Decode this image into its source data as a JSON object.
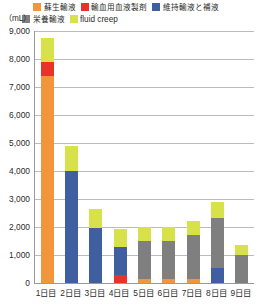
{
  "chart_data": {
    "type": "bar",
    "stacked": true,
    "title": "",
    "subtitle": "",
    "xlabel": "",
    "ylabel": "(mL)",
    "ylim": [
      0,
      9000
    ],
    "ytick_step": 1000,
    "grid": true,
    "legend_position": "top",
    "categories": [
      "1日目",
      "2日目",
      "3日目",
      "4日目",
      "5日目",
      "6日目",
      "7日目",
      "8日目",
      "9日目"
    ],
    "ytick_labels": [
      "9,000",
      "8,000",
      "7,000",
      "6,000",
      "5,000",
      "4,000",
      "3,000",
      "2,000",
      "1,000",
      "0"
    ],
    "ytick_values": [
      9000,
      8000,
      7000,
      6000,
      5000,
      4000,
      3000,
      2000,
      1000,
      0
    ],
    "series": [
      {
        "name": "蘇生輸液",
        "color": "#F2953C",
        "values": [
          7400,
          0,
          0,
          0,
          130,
          150,
          130,
          0,
          0
        ]
      },
      {
        "name": "輸血用血液製剤",
        "color": "#E8322A",
        "values": [
          500,
          0,
          0,
          300,
          0,
          0,
          0,
          0,
          0
        ]
      },
      {
        "name": "維持輸液と補液",
        "color": "#3F5FA0",
        "values": [
          0,
          4000,
          1950,
          1000,
          0,
          0,
          0,
          550,
          0
        ]
      },
      {
        "name": "栄養輸液",
        "color": "#7F7F7F",
        "values": [
          0,
          0,
          0,
          0,
          1380,
          1360,
          1580,
          1760,
          1000
        ]
      },
      {
        "name": "fluid creep",
        "color": "#D7E24B",
        "values": [
          850,
          880,
          700,
          620,
          500,
          500,
          490,
          570,
          350
        ]
      }
    ],
    "totals": [
      8750,
      4880,
      2650,
      1920,
      2010,
      2010,
      2200,
      2880,
      1350
    ]
  },
  "legend": {
    "row1": [
      {
        "label": "蘇生輸液",
        "color": "#F2953C",
        "latin": false
      },
      {
        "label": "輸血用血液製剤",
        "color": "#E8322A",
        "latin": false
      },
      {
        "label": "維持輸液と補液",
        "color": "#3F5FA0",
        "latin": false
      }
    ],
    "row2": [
      {
        "label": "栄養輸液",
        "color": "#7F7F7F",
        "latin": false
      },
      {
        "label": "fluid creep",
        "color": "#D7E24B",
        "latin": true
      }
    ]
  },
  "axis": {
    "unit": "（mL）"
  },
  "colors": {
    "gridline": "#b9bcc4",
    "axis": "#9a9a9a",
    "text": "#2b2b2b",
    "background": "#ffffff"
  }
}
